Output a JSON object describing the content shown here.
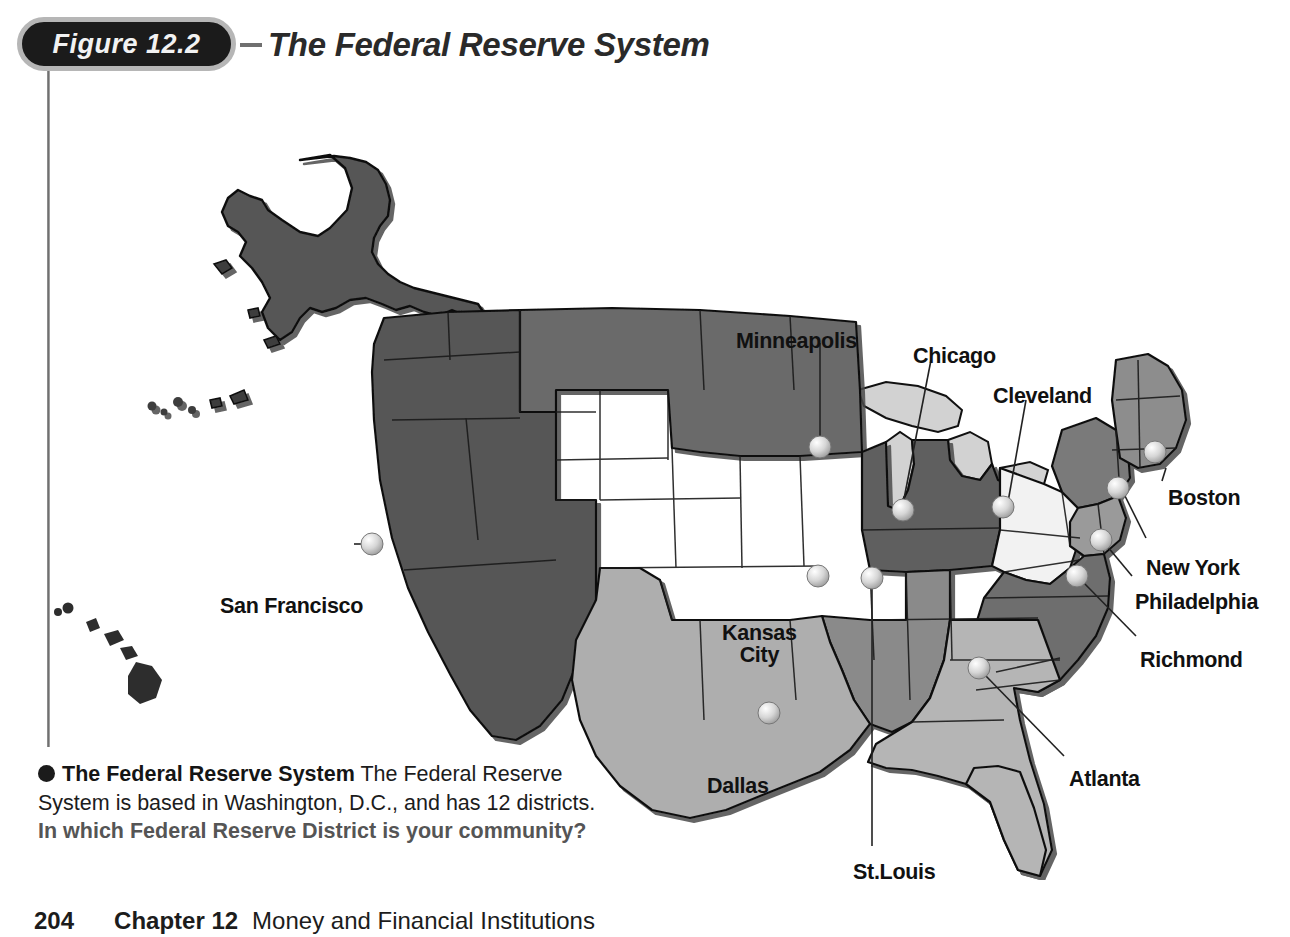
{
  "figure": {
    "badge_label": "Figure 12.2",
    "dash": "–",
    "title": "The Federal Reserve System"
  },
  "map": {
    "alt": "Map of the United States divided into the twelve Federal Reserve Districts, with Alaska and Hawaii insets",
    "district_colors": {
      "san_francisco": "#575757",
      "minneapolis": "#6b6b6b",
      "chicago": "#5f5f5f",
      "kansas_city": "#d9d9d9",
      "cleveland": "#f2f2f2",
      "boston": "#8d8d8d",
      "new_york": "#7a7a7a",
      "philadelphia": "#9a9a9a",
      "richmond": "#6e6e6e",
      "atlanta": "#b5b5b5",
      "dallas": "#aeaeae",
      "st_louis": "#8a8a8a",
      "water": "#d2d2d2",
      "outline": "#111111",
      "marker": "#c9c9c9"
    },
    "cities": [
      {
        "name": "Minneapolis",
        "label": "Minneapolis",
        "label_x": 736,
        "label_y": 270,
        "marker_x": 820,
        "marker_y": 387,
        "leader": "vertical"
      },
      {
        "name": "Chicago",
        "label": "Chicago",
        "label_x": 913,
        "label_y": 285,
        "marker_x": 903,
        "marker_y": 450,
        "leader": "vertical"
      },
      {
        "name": "Cleveland",
        "label": "Cleveland",
        "label_x": 993,
        "label_y": 325,
        "marker_x": 1003,
        "marker_y": 447,
        "leader": "diagonal"
      },
      {
        "name": "Boston",
        "label": "Boston",
        "label_x": 1168,
        "label_y": 427,
        "marker_x": 1155,
        "marker_y": 392,
        "leader": "diagonal"
      },
      {
        "name": "New York",
        "label": "New York",
        "label_x": 1146,
        "label_y": 497,
        "marker_x": 1118,
        "marker_y": 428,
        "leader": "diagonal"
      },
      {
        "name": "Philadelphia",
        "label": "Philadelphia",
        "label_x": 1135,
        "label_y": 531,
        "marker_x": 1101,
        "marker_y": 480,
        "leader": "diagonal"
      },
      {
        "name": "Richmond",
        "label": "Richmond",
        "label_x": 1140,
        "label_y": 589,
        "marker_x": 1077,
        "marker_y": 516,
        "leader": "diagonal"
      },
      {
        "name": "San Francisco",
        "label": "San Francisco",
        "label_x": 220,
        "label_y": 535,
        "marker_x": 372,
        "marker_y": 484,
        "leader": "horizontal"
      },
      {
        "name": "Kansas City",
        "label": "Kansas\nCity",
        "label_x": 722,
        "label_y": 562,
        "marker_x": 818,
        "marker_y": 516,
        "leader": "none"
      },
      {
        "name": "St. Louis",
        "label": "St.Louis",
        "label_x": 853,
        "label_y": 801,
        "marker_x": 872,
        "marker_y": 518,
        "leader": "vertical"
      },
      {
        "name": "Dallas",
        "label": "Dallas",
        "label_x": 707,
        "label_y": 715,
        "marker_x": 769,
        "marker_y": 653,
        "leader": "none"
      },
      {
        "name": "Atlanta",
        "label": "Atlanta",
        "label_x": 1069,
        "label_y": 708,
        "marker_x": 979,
        "marker_y": 608,
        "leader": "diagonal"
      }
    ]
  },
  "caption": {
    "lead": "The Federal Reserve System",
    "body": "The Federal Reserve System is based in Washington, D.C., and has 12 districts.",
    "question": "In which Federal Reserve District is your community?"
  },
  "footer": {
    "page_number": "204",
    "chapter": "Chapter 12",
    "subject": "Money and Financial Institutions"
  }
}
